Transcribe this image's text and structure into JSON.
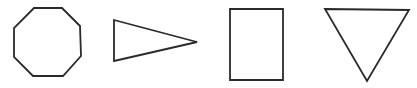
{
  "figure": {
    "shapes": [
      {
        "name": "octagon",
        "sides": 8
      },
      {
        "name": "triangle-pointing-right",
        "sides": 3
      },
      {
        "name": "rectangle",
        "sides": 4
      },
      {
        "name": "triangle-pointing-down",
        "sides": 3
      }
    ],
    "colors": {
      "stroke": "#2a2a2a",
      "background": "#ffffff"
    }
  }
}
